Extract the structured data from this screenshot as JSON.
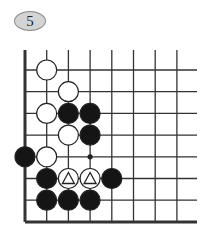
{
  "problem": {
    "number": "5"
  },
  "board": {
    "origin_x": 25,
    "origin_y": 70,
    "spacing": 21.7,
    "columns": 8,
    "rows": 8,
    "top_line_y": 50,
    "right_line_x": 197,
    "line_color": "#333333",
    "stones": [
      {
        "color": "white",
        "col": 1,
        "row": 0
      },
      {
        "color": "white",
        "col": 2,
        "row": 1
      },
      {
        "color": "white",
        "col": 1,
        "row": 2
      },
      {
        "color": "black",
        "col": 2,
        "row": 2
      },
      {
        "color": "black",
        "col": 3,
        "row": 2
      },
      {
        "color": "white",
        "col": 2,
        "row": 3
      },
      {
        "color": "black",
        "col": 3,
        "row": 3
      },
      {
        "color": "black",
        "col": 0,
        "row": 4
      },
      {
        "color": "white",
        "col": 1,
        "row": 4
      },
      {
        "color": "black",
        "col": 1,
        "row": 5
      },
      {
        "color": "white",
        "col": 2,
        "row": 5,
        "mark": "triangle"
      },
      {
        "color": "white",
        "col": 3,
        "row": 5,
        "mark": "triangle"
      },
      {
        "color": "black",
        "col": 4,
        "row": 5
      },
      {
        "color": "black",
        "col": 1,
        "row": 6
      },
      {
        "color": "black",
        "col": 2,
        "row": 6
      },
      {
        "color": "black",
        "col": 3,
        "row": 6
      }
    ],
    "points": [
      {
        "col": 3,
        "row": 4,
        "type": "dot"
      }
    ]
  }
}
